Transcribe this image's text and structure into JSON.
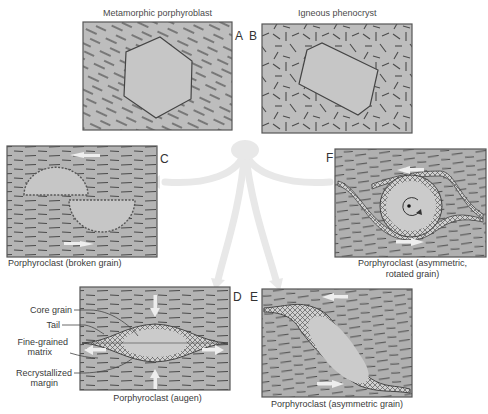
{
  "panels": {
    "A": {
      "letter": "A",
      "title": "Metamorphic porphyroblast"
    },
    "B": {
      "letter": "B",
      "title": "Igneous phenocryst"
    },
    "C": {
      "letter": "C",
      "caption": "Porphyroclast (broken grain)"
    },
    "D": {
      "letter": "D",
      "caption": "Porphyroclast (augen)",
      "labels": {
        "core": "Core grain",
        "tail": "Tail",
        "matrix_1": "Fine-grained",
        "matrix_2": "matrix",
        "margin_1": "Recrystallized",
        "margin_2": "margin"
      }
    },
    "E": {
      "letter": "E",
      "caption": "Porphyroclast (asymmetric grain)"
    },
    "F": {
      "letter": "F",
      "caption_1": "Porphyroclast (asymmetric,",
      "caption_2": "rotated grain)"
    }
  },
  "colors": {
    "matrix": "#b9b9b9",
    "grain": "#c9c9c9",
    "border": "#4a4a4a",
    "arrow": "#e6e6e6",
    "dark_matrix": "#a8a8a8"
  }
}
